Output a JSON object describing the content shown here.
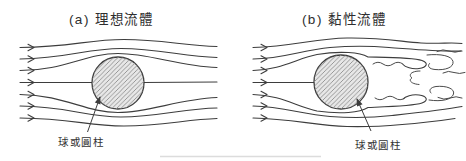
{
  "figure": {
    "panel_a": {
      "title": "(a) 理想流體",
      "label": "球或圓柱"
    },
    "panel_b": {
      "title": "(b) 黏性流體",
      "label": "球或圓柱"
    }
  },
  "icons": {
    "flow_arrow": "chevron-right-icon",
    "label_pointer": "arrow-up-icon"
  },
  "colors": {
    "line": "#3d3d3d",
    "circle_fill": "#e7e7e7",
    "hatch_line": "#8f8f8f",
    "background": "#ffffff",
    "divider": "#dcdcdc"
  }
}
